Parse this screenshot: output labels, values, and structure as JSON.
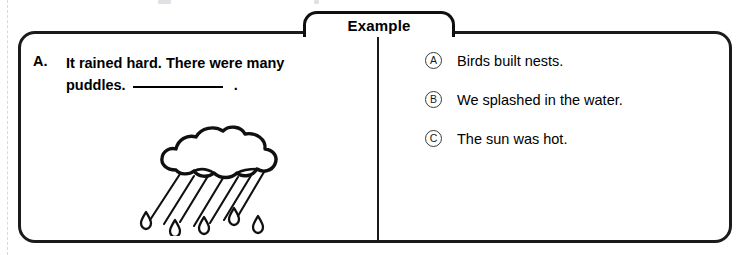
{
  "tab": {
    "label": "Example"
  },
  "question": {
    "letter": "A.",
    "line1": "It rained hard. There were many",
    "line2_before_blank": "puddles.",
    "line2_after_blank": ".",
    "blank_present": true
  },
  "illustration": {
    "name": "rain-cloud-illustration",
    "description": "A hand-drawn cloud with diagonal rain streaks and teardrops falling below it"
  },
  "options": [
    {
      "label": "A",
      "text": "Birds built nests."
    },
    {
      "label": "B",
      "text": "We splashed in the water."
    },
    {
      "label": "C",
      "text": "The sun was hot."
    }
  ],
  "colors": {
    "border": "#1b1b1b",
    "text": "#000000",
    "bubble_outline": "#3a3a3a",
    "background": "#ffffff",
    "fold_guide": "#d9d9d9"
  }
}
